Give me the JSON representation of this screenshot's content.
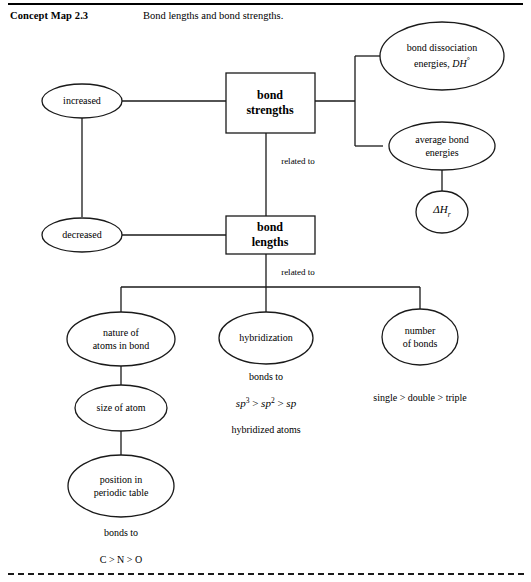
{
  "header": {
    "label": "Concept Map 2.3",
    "caption": "Bond lengths and bond strengths."
  },
  "nodes": {
    "bond_strengths": "bond strengths",
    "bond_lengths": "bond lengths",
    "increased": "increased",
    "decreased": "decreased",
    "bond_dissociation": "bond dissociation energies, DH°",
    "bond_dissociation_line1": "bond dissociation",
    "bond_dissociation_line2": "energies,",
    "bond_dissociation_symbol": "DH",
    "bond_dissociation_degree": "°",
    "average_bond_line1": "average bond",
    "average_bond_line2": "energies",
    "delta_h_symbol": "ΔH",
    "delta_h_subscript": "r",
    "nature_line1": "nature of",
    "nature_line2": "atoms in bond",
    "hybridization": "hybridization",
    "number_line1": "number",
    "number_line2": "of bonds",
    "size_of_atom": "size of atom",
    "position_line1": "position in",
    "position_line2": "periodic table"
  },
  "edge_labels": {
    "related_to_upper": "related to",
    "related_to_lower": "related to",
    "bonds_to_hybrid": "bonds to",
    "bonds_to_position": "bonds to"
  },
  "annotations": {
    "sp_series_sp3": "sp",
    "sp_series_exp3": "3",
    "sp_series_gt1": ">",
    "sp_series_sp2": "sp",
    "sp_series_exp2": "2",
    "sp_series_gt2": ">",
    "sp_series_sp": "sp",
    "hybridized_atoms": "hybridized atoms",
    "bond_order_series": "single > double > triple",
    "electronegativity_series": "C > N > O"
  },
  "colors": {
    "stroke": "#1a1a1a",
    "text": "#000000",
    "background": "#ffffff"
  }
}
